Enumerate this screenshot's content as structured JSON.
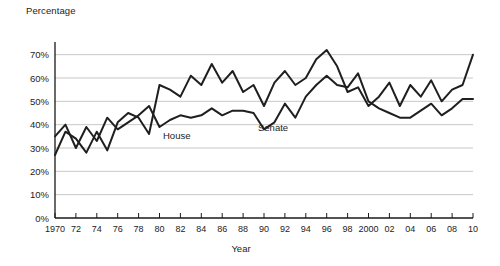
{
  "chart_data": {
    "type": "line",
    "title": "",
    "ylabel": "Percentage",
    "xlabel": "Year",
    "ylim": [
      0,
      75
    ],
    "yticks": [
      "0%",
      "10%",
      "20%",
      "30%",
      "40%",
      "50%",
      "60%",
      "70%"
    ],
    "ytick_values": [
      0,
      10,
      20,
      30,
      40,
      50,
      60,
      70
    ],
    "xlim": [
      1970,
      2010
    ],
    "xticks": [
      "1970",
      "72",
      "74",
      "76",
      "78",
      "80",
      "82",
      "84",
      "86",
      "88",
      "90",
      "92",
      "94",
      "96",
      "98",
      "2000",
      "02",
      "04",
      "06",
      "08",
      "10"
    ],
    "xtick_values": [
      1970,
      1972,
      1974,
      1976,
      1978,
      1980,
      1982,
      1984,
      1986,
      1988,
      1990,
      1992,
      1994,
      1996,
      1998,
      2000,
      2002,
      2004,
      2006,
      2008,
      2010
    ],
    "grid": "horizontal",
    "legend": "inline-labels",
    "x": [
      1970,
      1971,
      1972,
      1973,
      1974,
      1975,
      1976,
      1977,
      1978,
      1979,
      1980,
      1981,
      1982,
      1983,
      1984,
      1985,
      1986,
      1987,
      1988,
      1989,
      1990,
      1991,
      1992,
      1993,
      1994,
      1995,
      1996,
      1997,
      1998,
      1999,
      2000,
      2001,
      2002,
      2003,
      2004,
      2005,
      2006,
      2007,
      2008,
      2009,
      2010
    ],
    "series": [
      {
        "name": "House",
        "label": "House",
        "color": "#1f1f1f",
        "values": [
          35,
          40,
          30,
          39,
          33,
          43,
          38,
          41,
          44,
          48,
          39,
          42,
          44,
          43,
          44,
          47,
          44,
          46,
          46,
          45,
          38,
          41,
          49,
          43,
          52,
          57,
          61,
          57,
          56,
          62,
          50,
          47,
          45,
          43,
          43,
          46,
          49,
          44,
          47,
          51,
          51
        ]
      },
      {
        "name": "Senate",
        "label": "Senate",
        "color": "#1f1f1f",
        "values": [
          27,
          37,
          34,
          28,
          37,
          29,
          41,
          45,
          43,
          36,
          57,
          55,
          52,
          61,
          57,
          66,
          58,
          63,
          54,
          57,
          48,
          58,
          63,
          57,
          60,
          68,
          72,
          65,
          54,
          56,
          48,
          52,
          58,
          48,
          57,
          52,
          59,
          50,
          55,
          57,
          70
        ]
      }
    ]
  }
}
